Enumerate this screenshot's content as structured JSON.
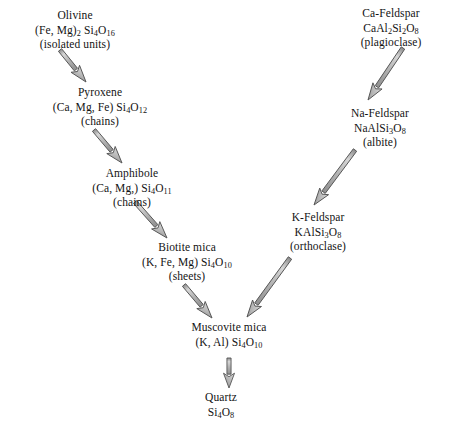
{
  "diagram": {
    "background_color": "#ffffff",
    "text_color": "#131313",
    "arrow_fill_color": "#b9b9b9",
    "arrow_stroke_color": "#555555",
    "nodes": [
      {
        "id": "olivine",
        "name": "Olivine",
        "formula_html": "(Fe, Mg)<sub>2</sub> Si<sub>4</sub>O<sub>16</sub>",
        "structure": "(isolated units)",
        "x": 75,
        "y": 8
      },
      {
        "id": "pyroxene",
        "name": "Pyroxene",
        "formula_html": "(Ca, Mg, Fe) Si<sub>4</sub>O<sub>12</sub>",
        "structure": "(chains)",
        "x": 100,
        "y": 85
      },
      {
        "id": "amphibole",
        "name": "Amphibole",
        "formula_html": "(Ca, Mg,) Si<sub>4</sub>O<sub>11</sub>",
        "structure": "(chains)",
        "x": 132,
        "y": 166
      },
      {
        "id": "biotite-mica",
        "name": "Biotite mica",
        "formula_html": "(K, Fe, Mg) Si<sub>4</sub>O<sub>10</sub>",
        "structure": "(sheets)",
        "x": 187,
        "y": 240
      },
      {
        "id": "ca-feldspar",
        "name": "Ca-Feldspar",
        "formula_html": "CaAl<sub>2</sub>Si<sub>2</sub>O<sub>8</sub>",
        "structure": "(plagioclase)",
        "x": 391,
        "y": 6
      },
      {
        "id": "na-feldspar",
        "name": "Na-Feldspar",
        "formula_html": "NaAlSi<sub>3</sub>O<sub>8</sub>",
        "structure": "(albite)",
        "x": 380,
        "y": 106
      },
      {
        "id": "k-feldspar",
        "name": "K-Feldspar",
        "formula_html": "KAlSi<sub>3</sub>O<sub>8</sub>",
        "structure": "(orthoclase)",
        "x": 318,
        "y": 210
      },
      {
        "id": "muscovite-mica",
        "name": "Muscovite mica",
        "formula_html": "(K, Al) Si<sub>4</sub>O<sub>10</sub>",
        "structure": "",
        "x": 229,
        "y": 320
      },
      {
        "id": "quartz",
        "name": "Quartz",
        "formula_html": "Si<sub>4</sub>O<sub>8</sub>",
        "structure": "",
        "x": 221,
        "y": 390
      }
    ],
    "arrows": [
      {
        "id": "olivine-to-pyroxene",
        "from": "olivine",
        "to": "pyroxene",
        "x1": 60,
        "y1": 50,
        "x2": 86,
        "y2": 82,
        "style": "block-3d"
      },
      {
        "id": "pyroxene-to-amphibole",
        "from": "pyroxene",
        "to": "amphibole",
        "x1": 94,
        "y1": 130,
        "x2": 122,
        "y2": 163,
        "style": "block-3d"
      },
      {
        "id": "amphibole-to-biotite",
        "from": "amphibole",
        "to": "biotite-mica",
        "x1": 135,
        "y1": 202,
        "x2": 167,
        "y2": 238,
        "style": "block-3d"
      },
      {
        "id": "biotite-to-muscovite",
        "from": "biotite-mica",
        "to": "muscovite-mica",
        "x1": 184,
        "y1": 285,
        "x2": 212,
        "y2": 318,
        "style": "block-3d"
      },
      {
        "id": "muscovite-to-quartz",
        "from": "muscovite-mica",
        "to": "quartz",
        "x1": 229,
        "y1": 358,
        "x2": 229,
        "y2": 388,
        "style": "block-3d"
      },
      {
        "id": "ca-feldspar-to-na-feldspar",
        "from": "ca-feldspar",
        "to": "na-feldspar",
        "x1": 403,
        "y1": 48,
        "x2": 368,
        "y2": 100,
        "style": "block-3d"
      },
      {
        "id": "na-feldspar-to-k-feldspar",
        "from": "na-feldspar",
        "to": "k-feldspar",
        "x1": 355,
        "y1": 150,
        "x2": 314,
        "y2": 205,
        "style": "block-3d"
      },
      {
        "id": "k-feldspar-to-muscovite",
        "from": "k-feldspar",
        "to": "muscovite-mica",
        "x1": 290,
        "y1": 258,
        "x2": 247,
        "y2": 317,
        "style": "block-3d"
      }
    ]
  }
}
